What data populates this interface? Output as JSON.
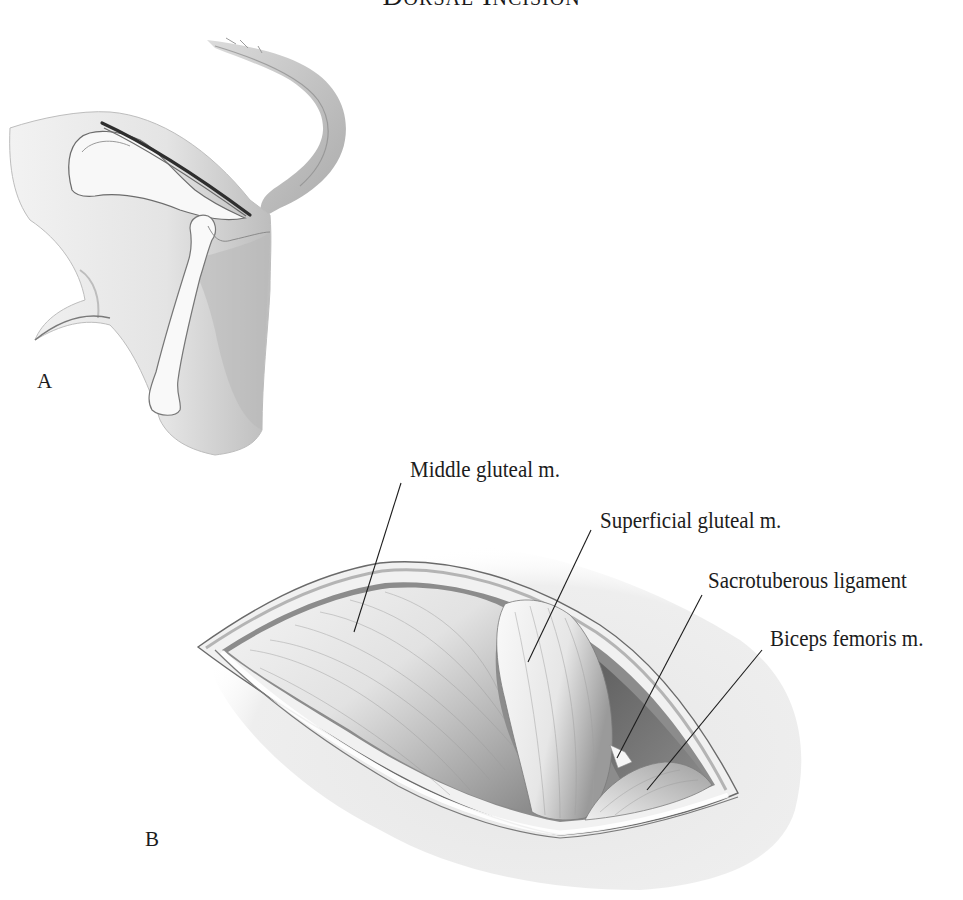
{
  "figure": {
    "title": "Dorsal Incision",
    "panels": [
      {
        "id": "A",
        "letter": "A",
        "description": "Lateral view of canine pelvis and hindlimb showing dorsal skin incision line over ilium and femur"
      },
      {
        "id": "B",
        "letter": "B",
        "description": "Opened dorsal incision exposing gluteal musculature"
      }
    ],
    "labels": [
      {
        "text": "Middle gluteal m.",
        "x": 410,
        "y": 460
      },
      {
        "text": "Superficial gluteal m.",
        "x": 600,
        "y": 511
      },
      {
        "text": "Sacrotuberous ligament",
        "x": 708,
        "y": 571
      },
      {
        "text": "Biceps femoris m.",
        "x": 770,
        "y": 629
      }
    ],
    "leader_lines": [
      {
        "label": "Middle gluteal m.",
        "x1": 401,
        "y1": 483,
        "x2": 354,
        "y2": 632
      },
      {
        "label": "Superficial gluteal m.",
        "x1": 591,
        "y1": 530,
        "x2": 528,
        "y2": 662
      },
      {
        "label": "Sacrotuberous ligament",
        "x1": 702,
        "y1": 595,
        "x2": 617,
        "y2": 758
      },
      {
        "label": "Biceps femoris m.",
        "x1": 762,
        "y1": 650,
        "x2": 647,
        "y2": 790
      }
    ],
    "panel_letters": [
      {
        "letter": "A",
        "x": 37,
        "y": 372
      },
      {
        "letter": "B",
        "x": 145,
        "y": 830
      }
    ],
    "colors": {
      "ink": "#1c1c1c",
      "shade_dark": "#6e6e6e",
      "shade_mid": "#a8a8a8",
      "shade_light": "#d8d8d8",
      "paper": "#ffffff"
    }
  }
}
